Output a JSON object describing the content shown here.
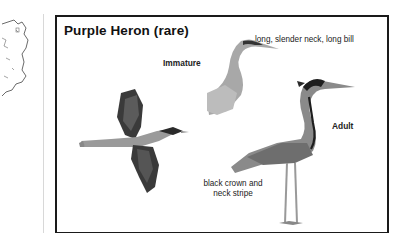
{
  "panel": {
    "title": "Purple Heron (rare)",
    "labels": {
      "immature": "Immature",
      "neck_bill": "long, slender neck, long bill",
      "adult": "Adult",
      "crown_line1": "black crown and",
      "crown_line2": "neck stripe"
    }
  },
  "figures": {
    "flying": "flying-heron-illustration",
    "immature": "immature-heron-illustration",
    "adult": "adult-heron-illustration"
  },
  "sidebar_map": "ireland-outline-map"
}
